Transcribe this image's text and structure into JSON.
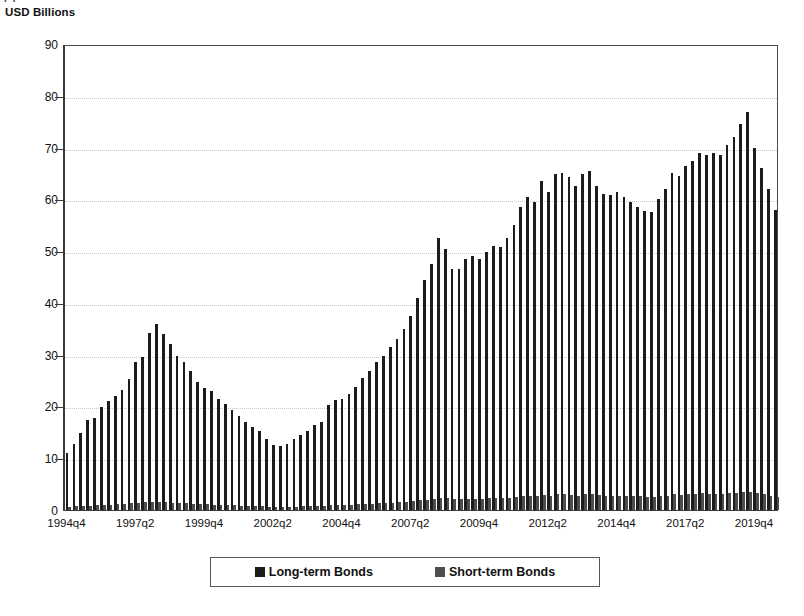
{
  "figure": {
    "caption_fragment": "( )",
    "axis_title": "USD Billions"
  },
  "legend": {
    "items": [
      {
        "label": "Long-term Bonds",
        "color": "#1c1c1c",
        "swatch": "legend-swatch-long"
      },
      {
        "label": "Short-term Bonds",
        "color": "#4d4d4d",
        "swatch": "legend-swatch-short"
      }
    ]
  },
  "chart_data": {
    "type": "bar",
    "title": "",
    "subtitle": "",
    "xlabel": "",
    "ylabel": "USD Billions",
    "ylim": [
      0,
      90
    ],
    "ytick_step": 10,
    "yticks": [
      0,
      10,
      20,
      30,
      40,
      50,
      60,
      70,
      80,
      90
    ],
    "grid": true,
    "grid_style": "dotted horizontal",
    "legend_position": "bottom",
    "bar_mode": "grouped",
    "x_tick_labels": [
      "1994q4",
      "1997q2",
      "1999q4",
      "2002q2",
      "2004q4",
      "2007q2",
      "2009q4",
      "2012q2",
      "2014q4",
      "2017q2",
      "2019q4"
    ],
    "x_tick_indices": [
      0,
      10,
      20,
      30,
      40,
      50,
      60,
      70,
      80,
      90,
      100
    ],
    "categories": [
      "1994q4",
      "1995q1",
      "1995q2",
      "1995q3",
      "1995q4",
      "1996q1",
      "1996q2",
      "1996q3",
      "1996q4",
      "1997q1",
      "1997q2",
      "1997q3",
      "1997q4",
      "1998q1",
      "1998q2",
      "1998q3",
      "1998q4",
      "1999q1",
      "1999q2",
      "1999q3",
      "1999q4",
      "2000q1",
      "2000q2",
      "2000q3",
      "2000q4",
      "2001q1",
      "2001q2",
      "2001q3",
      "2001q4",
      "2002q1",
      "2002q2",
      "2002q3",
      "2002q4",
      "2003q1",
      "2003q2",
      "2003q3",
      "2003q4",
      "2004q1",
      "2004q2",
      "2004q3",
      "2004q4",
      "2005q1",
      "2005q2",
      "2005q3",
      "2005q4",
      "2006q1",
      "2006q2",
      "2006q3",
      "2006q4",
      "2007q1",
      "2007q2",
      "2007q3",
      "2007q4",
      "2008q1",
      "2008q2",
      "2008q3",
      "2008q4",
      "2009q1",
      "2009q2",
      "2009q3",
      "2009q4",
      "2010q1",
      "2010q2",
      "2010q3",
      "2010q4",
      "2011q1",
      "2011q2",
      "2011q3",
      "2011q4",
      "2012q1",
      "2012q2",
      "2012q3",
      "2012q4",
      "2013q1",
      "2013q2",
      "2013q3",
      "2013q4",
      "2014q1",
      "2014q2",
      "2014q3",
      "2014q4",
      "2015q1",
      "2015q2",
      "2015q3",
      "2015q4",
      "2016q1",
      "2016q2",
      "2016q3",
      "2016q4",
      "2017q1",
      "2017q2",
      "2017q3",
      "2017q4",
      "2018q1",
      "2018q2",
      "2018q3",
      "2018q4",
      "2019q1",
      "2019q2",
      "2019q3",
      "2019q4",
      "2020q1",
      "2020q2",
      "2020q3"
    ],
    "series": [
      {
        "name": "Long-term Bonds",
        "color": "#1c1c1c",
        "values": [
          11.0,
          12.8,
          14.8,
          17.3,
          17.8,
          19.8,
          21.0,
          22.0,
          23.2,
          25.3,
          28.5,
          29.5,
          34.2,
          36.0,
          34.0,
          32.0,
          29.8,
          28.5,
          26.8,
          24.8,
          23.5,
          23.0,
          21.5,
          20.5,
          19.3,
          18.2,
          17.0,
          16.0,
          15.2,
          13.8,
          12.6,
          12.4,
          12.8,
          13.8,
          14.5,
          15.3,
          16.5,
          17.0,
          20.3,
          21.2,
          21.5,
          22.5,
          23.8,
          25.5,
          26.8,
          28.5,
          29.8,
          31.5,
          33.0,
          35.0,
          37.5,
          41.0,
          44.5,
          47.5,
          52.5,
          50.5,
          46.5,
          46.5,
          48.5,
          49.0,
          48.5,
          49.8,
          51.0,
          50.8,
          52.5,
          55.0,
          58.5,
          60.5,
          59.5,
          63.5,
          61.5,
          64.8,
          65.0,
          64.3,
          62.5,
          64.8,
          65.5,
          62.5,
          61.0,
          60.8,
          61.5,
          60.5,
          59.5,
          58.5,
          57.8,
          57.5,
          60.0,
          62.0,
          65.0,
          64.5,
          66.5,
          67.5,
          69.0,
          68.5,
          69.0,
          68.5,
          70.5,
          72.0,
          74.5,
          76.8,
          70.0,
          66.0,
          62.0,
          58.0
        ]
      },
      {
        "name": "Short-term Bonds",
        "color": "#4d4d4d",
        "values": [
          0.6,
          0.7,
          0.8,
          0.8,
          0.9,
          1.0,
          1.0,
          1.1,
          1.2,
          1.3,
          1.4,
          1.5,
          1.6,
          1.6,
          1.5,
          1.4,
          1.3,
          1.3,
          1.2,
          1.1,
          1.1,
          1.0,
          1.0,
          0.9,
          0.9,
          0.8,
          0.8,
          0.7,
          0.7,
          0.6,
          0.6,
          0.6,
          0.6,
          0.6,
          0.7,
          0.7,
          0.8,
          0.8,
          0.9,
          1.0,
          1.0,
          1.0,
          1.1,
          1.2,
          1.2,
          1.3,
          1.4,
          1.4,
          1.5,
          1.6,
          1.7,
          1.9,
          2.0,
          2.2,
          2.4,
          2.3,
          2.1,
          2.1,
          2.2,
          2.2,
          2.2,
          2.3,
          2.3,
          2.3,
          2.4,
          2.5,
          2.7,
          2.8,
          2.7,
          2.9,
          2.8,
          3.0,
          3.0,
          2.9,
          2.8,
          3.0,
          3.0,
          2.9,
          2.8,
          2.8,
          2.8,
          2.8,
          2.7,
          2.7,
          2.6,
          2.6,
          2.7,
          2.8,
          3.0,
          2.9,
          3.0,
          3.1,
          3.2,
          3.1,
          3.1,
          3.1,
          3.2,
          3.3,
          3.4,
          3.5,
          3.2,
          3.0,
          2.8,
          2.6
        ]
      }
    ]
  }
}
